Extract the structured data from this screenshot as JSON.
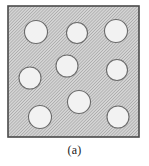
{
  "figure": {
    "caption": "(a)",
    "panel_label": "(a)",
    "title": "",
    "kind": "microstructure-schematic"
  },
  "matrix": {
    "name": "hatched-matrix-region",
    "shape": "square",
    "x": 8,
    "y": 6,
    "width": 131,
    "height": 131,
    "fill_color": "#d4d4d4",
    "hatch_color": "#8f8f8f",
    "hatch_angle_deg": 45,
    "hatch_spacing_px": 2.2,
    "hatch_line_width_px": 0.85,
    "border_color": "#4a4a4a",
    "border_width_px": 1.6
  },
  "inclusions": {
    "count": 9,
    "fill_color": "#f2f2f2",
    "stroke_color": "#6b6b6b",
    "stroke_width_px": 1.1,
    "items": [
      {
        "id": "inclusion-1",
        "label": "top-left",
        "cx": 36,
        "cy": 32,
        "r": 11.5
      },
      {
        "id": "inclusion-2",
        "label": "top-center",
        "cx": 77,
        "cy": 33,
        "r": 10.5
      },
      {
        "id": "inclusion-3",
        "label": "top-right",
        "cx": 116,
        "cy": 31,
        "r": 11.5
      },
      {
        "id": "inclusion-4",
        "label": "mid-center",
        "cx": 67,
        "cy": 66,
        "r": 11.0
      },
      {
        "id": "inclusion-5",
        "label": "mid-left",
        "cx": 30,
        "cy": 78,
        "r": 11.0
      },
      {
        "id": "inclusion-6",
        "label": "mid-right",
        "cx": 117,
        "cy": 70,
        "r": 10.5
      },
      {
        "id": "inclusion-7",
        "label": "lower-center",
        "cx": 79,
        "cy": 102,
        "r": 11.5
      },
      {
        "id": "inclusion-8",
        "label": "bottom-left",
        "cx": 40,
        "cy": 117,
        "r": 11.5
      },
      {
        "id": "inclusion-9",
        "label": "bottom-right",
        "cx": 118,
        "cy": 117,
        "r": 11.0
      }
    ]
  }
}
